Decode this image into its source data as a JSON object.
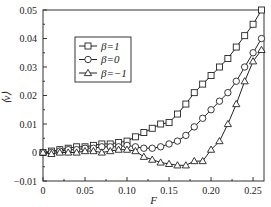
{
  "chart_data": {
    "type": "line",
    "title": "",
    "xlabel": "F",
    "ylabel": "⟨v⟩",
    "xlim": [
      0,
      0.263
    ],
    "ylim": [
      -0.01,
      0.05
    ],
    "xticks": [
      "0",
      "0.05",
      "0.10",
      "0.15",
      "0.20",
      "0.25"
    ],
    "yticks": [
      "-0.01",
      "0",
      "0.01",
      "0.02",
      "0.03",
      "0.04",
      "0.05"
    ],
    "grid": false,
    "legend_position": "upper left",
    "x": [
      0,
      0.01,
      0.02,
      0.03,
      0.04,
      0.05,
      0.06,
      0.07,
      0.08,
      0.09,
      0.1,
      0.11,
      0.12,
      0.13,
      0.14,
      0.15,
      0.16,
      0.17,
      0.18,
      0.19,
      0.2,
      0.21,
      0.22,
      0.23,
      0.24,
      0.25,
      0.26
    ],
    "series": [
      {
        "name": "β=1",
        "marker": "square",
        "values": [
          0,
          0.0005,
          0.001,
          0.0015,
          0.002,
          0.002,
          0.0025,
          0.003,
          0.003,
          0.0035,
          0.004,
          0.0055,
          0.007,
          0.0085,
          0.01,
          0.0105,
          0.0135,
          0.017,
          0.021,
          0.024,
          0.027,
          0.03,
          0.033,
          0.037,
          0.041,
          0.045,
          0.05
        ]
      },
      {
        "name": "β=0",
        "marker": "circle",
        "values": [
          0,
          0,
          0.0005,
          0.001,
          0.001,
          0.0015,
          0.0015,
          0.002,
          0.002,
          0.002,
          0.0025,
          0.002,
          0.0015,
          0.0015,
          0.002,
          0.003,
          0.004,
          0.006,
          0.009,
          0.012,
          0.015,
          0.018,
          0.021,
          0.025,
          0.03,
          0.035,
          0.04
        ]
      },
      {
        "name": "β=−1",
        "marker": "triangle",
        "values": [
          0,
          -0.0005,
          0,
          0,
          0,
          0.0005,
          0.0005,
          0,
          0.0005,
          0.001,
          0.001,
          0.0005,
          -0.0015,
          -0.0025,
          -0.0035,
          -0.004,
          -0.0045,
          -0.0045,
          -0.003,
          -0.003,
          0.001,
          0.004,
          0.01,
          0.017,
          0.025,
          0.032,
          0.036
        ]
      }
    ]
  }
}
